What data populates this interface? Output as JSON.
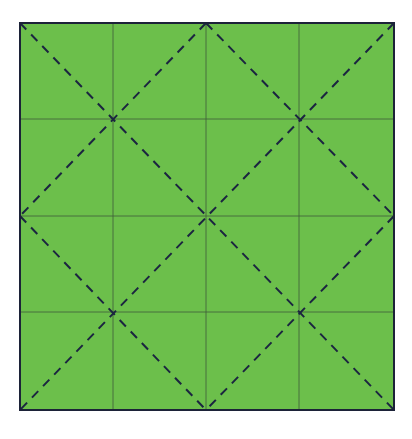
{
  "diagram": {
    "paper": {
      "x": 20,
      "y": 23,
      "width": 374,
      "height": 387
    },
    "grid_divisions": 4,
    "colors": {
      "paper": "#6cbf4b",
      "border": "#1c2238",
      "grid_line": "#3f5a3a",
      "fold_line": "#1b2540"
    },
    "grid_lines": {
      "vertical_x": [
        113,
        206,
        299
      ],
      "horizontal_y": [
        119,
        216,
        312
      ]
    },
    "diagonal_folds": [
      {
        "from": [
          0,
          0
        ],
        "to": [
          4,
          4
        ],
        "style": "dashed"
      },
      {
        "from": [
          2,
          0
        ],
        "to": [
          4,
          2
        ],
        "style": "dashed"
      },
      {
        "from": [
          0,
          2
        ],
        "to": [
          2,
          4
        ],
        "style": "dashed"
      },
      {
        "from": [
          2,
          0
        ],
        "to": [
          0,
          2
        ],
        "style": "dashed"
      },
      {
        "from": [
          4,
          0
        ],
        "to": [
          0,
          4
        ],
        "style": "dashed"
      },
      {
        "from": [
          4,
          2
        ],
        "to": [
          2,
          4
        ],
        "style": "dashed"
      }
    ]
  }
}
